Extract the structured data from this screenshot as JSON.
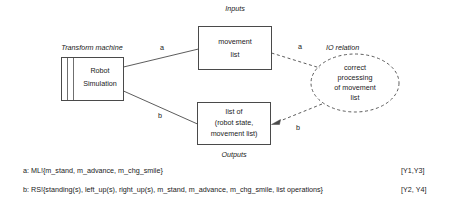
{
  "figure": {
    "section_labels": {
      "inputs": "Inputs",
      "outputs": "Outputs",
      "transform_machine": "Transform machine",
      "io_relation": "IO relation"
    },
    "nodes": {
      "machine": {
        "line1": "Robot",
        "line2": "Simulation"
      },
      "input_box": {
        "line1": "movement",
        "line2": "list"
      },
      "output_box": {
        "line1": "list of",
        "line2": "(robot state,",
        "line3": "movement list)"
      },
      "relation_ellipse": {
        "line1": "correct",
        "line2": "processing",
        "line3": "of movement",
        "line4": "list"
      }
    },
    "edge_labels": {
      "machine_to_input": "a",
      "machine_to_output": "b",
      "input_to_relation": "a",
      "relation_to_output": "b"
    },
    "legend": [
      {
        "text": "a: ML!{m_stand, m_advance, m_chg_smile}",
        "tag": "[Y1,Y3]"
      },
      {
        "text": "b: RS!{standing(s), left_up(s), right_up(s), m_stand, m_advance, m_chg_smile, list operations}",
        "tag": "[Y2, Y4]"
      }
    ],
    "colors": {
      "stroke": "#4a4a4a",
      "text": "#1a1a1a",
      "background": "#ffffff"
    }
  }
}
